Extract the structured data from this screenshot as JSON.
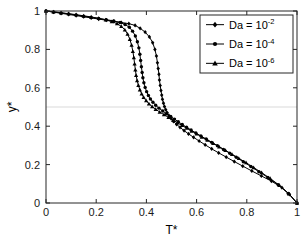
{
  "figure": {
    "background_color": "#ffffff",
    "axes_color": "#262626",
    "grid_color": "#d9d9d9",
    "curve_color": "#000000"
  },
  "chart_data": {
    "type": "line",
    "title": "",
    "subtitle": "",
    "xlabel": "T*",
    "ylabel": "y*",
    "xlim": [
      0,
      1
    ],
    "ylim": [
      0,
      1
    ],
    "xticks": [
      0,
      0.2,
      0.4,
      0.6,
      0.8,
      1
    ],
    "xticklabels": [
      "0",
      "0.2",
      "0.4",
      "0.6",
      "0.8",
      "1"
    ],
    "yticks": [
      0,
      0.2,
      0.4,
      0.6,
      0.8,
      1
    ],
    "yticklabels": [
      "0",
      "0.2",
      "0.4",
      "0.6",
      "0.8",
      "1"
    ],
    "grid": "horizontal gridline at y*=0.5 only",
    "gridlines_y": [
      0.5
    ],
    "legend_position": "upper right",
    "annotations": [],
    "series": [
      {
        "name": "Da = 10^-2",
        "label_base": "Da = 10",
        "label_exponent": "-2",
        "marker": "diamond",
        "color": "#000000",
        "x": [
          0.0,
          0.03,
          0.06,
          0.09,
          0.12,
          0.15,
          0.18,
          0.21,
          0.24,
          0.27,
          0.3,
          0.33,
          0.355,
          0.375,
          0.395,
          0.412,
          0.425,
          0.434,
          0.44,
          0.444,
          0.447,
          0.45,
          0.452,
          0.455,
          0.458,
          0.461,
          0.464,
          0.468,
          0.472,
          0.477,
          0.483,
          0.49,
          0.498,
          0.508,
          0.52,
          0.534,
          0.55,
          0.568,
          0.588,
          0.61,
          0.634,
          0.66,
          0.688,
          0.718,
          0.75,
          0.784,
          0.82,
          0.858,
          0.898,
          0.94,
          0.97,
          1.0
        ],
        "y": [
          1.0,
          0.994,
          0.988,
          0.982,
          0.976,
          0.97,
          0.964,
          0.958,
          0.952,
          0.946,
          0.94,
          0.934,
          0.925,
          0.91,
          0.89,
          0.865,
          0.835,
          0.8,
          0.765,
          0.73,
          0.7,
          0.67,
          0.64,
          0.612,
          0.586,
          0.562,
          0.54,
          0.52,
          0.502,
          0.486,
          0.47,
          0.455,
          0.44,
          0.425,
          0.41,
          0.394,
          0.377,
          0.36,
          0.342,
          0.323,
          0.303,
          0.282,
          0.261,
          0.239,
          0.216,
          0.192,
          0.167,
          0.141,
          0.114,
          0.08,
          0.045,
          0.0
        ]
      },
      {
        "name": "Da = 10^-4",
        "label_base": "Da = 10",
        "label_exponent": "-4",
        "marker": "circle",
        "color": "#000000",
        "x": [
          0.0,
          0.03,
          0.06,
          0.09,
          0.12,
          0.15,
          0.18,
          0.21,
          0.24,
          0.27,
          0.295,
          0.315,
          0.332,
          0.345,
          0.356,
          0.364,
          0.37,
          0.374,
          0.377,
          0.38,
          0.383,
          0.386,
          0.39,
          0.395,
          0.401,
          0.408,
          0.416,
          0.426,
          0.437,
          0.45,
          0.465,
          0.48,
          0.497,
          0.512,
          0.527,
          0.543,
          0.56,
          0.578,
          0.597,
          0.617,
          0.638,
          0.66,
          0.683,
          0.707,
          0.732,
          0.758,
          0.786,
          0.816,
          0.848,
          0.884,
          0.925,
          0.965,
          1.0
        ],
        "y": [
          1.0,
          0.995,
          0.99,
          0.985,
          0.979,
          0.973,
          0.967,
          0.961,
          0.955,
          0.948,
          0.94,
          0.93,
          0.915,
          0.895,
          0.87,
          0.84,
          0.808,
          0.775,
          0.742,
          0.71,
          0.68,
          0.652,
          0.626,
          0.602,
          0.58,
          0.56,
          0.542,
          0.525,
          0.509,
          0.494,
          0.479,
          0.465,
          0.451,
          0.437,
          0.423,
          0.409,
          0.395,
          0.38,
          0.365,
          0.349,
          0.333,
          0.316,
          0.298,
          0.279,
          0.259,
          0.238,
          0.215,
          0.19,
          0.163,
          0.133,
          0.095,
          0.05,
          0.0
        ]
      },
      {
        "name": "Da = 10^-6",
        "label_base": "Da = 10",
        "label_exponent": "-6",
        "marker": "triangle",
        "color": "#000000",
        "x": [
          0.0,
          0.03,
          0.06,
          0.09,
          0.12,
          0.15,
          0.18,
          0.21,
          0.238,
          0.262,
          0.283,
          0.3,
          0.314,
          0.325,
          0.334,
          0.341,
          0.346,
          0.35,
          0.353,
          0.356,
          0.359,
          0.363,
          0.368,
          0.374,
          0.381,
          0.389,
          0.399,
          0.41,
          0.423,
          0.437,
          0.453,
          0.47,
          0.488,
          0.506,
          0.524,
          0.542,
          0.561,
          0.58,
          0.6,
          0.621,
          0.643,
          0.666,
          0.69,
          0.715,
          0.741,
          0.768,
          0.797,
          0.827,
          0.859,
          0.893,
          0.93,
          0.968,
          1.0
        ],
        "y": [
          1.0,
          0.996,
          0.991,
          0.986,
          0.981,
          0.975,
          0.969,
          0.962,
          0.954,
          0.945,
          0.934,
          0.92,
          0.902,
          0.88,
          0.853,
          0.822,
          0.79,
          0.757,
          0.725,
          0.694,
          0.665,
          0.638,
          0.613,
          0.59,
          0.569,
          0.55,
          0.533,
          0.517,
          0.502,
          0.488,
          0.474,
          0.46,
          0.446,
          0.432,
          0.418,
          0.404,
          0.39,
          0.375,
          0.36,
          0.344,
          0.328,
          0.311,
          0.293,
          0.274,
          0.254,
          0.233,
          0.21,
          0.185,
          0.158,
          0.128,
          0.092,
          0.048,
          0.0
        ]
      }
    ]
  },
  "legend": {
    "entries": [
      {
        "base": "Da = 10",
        "exponent": "-2",
        "marker": "diamond"
      },
      {
        "base": "Da = 10",
        "exponent": "-4",
        "marker": "circle"
      },
      {
        "base": "Da = 10",
        "exponent": "-6",
        "marker": "triangle"
      }
    ]
  }
}
